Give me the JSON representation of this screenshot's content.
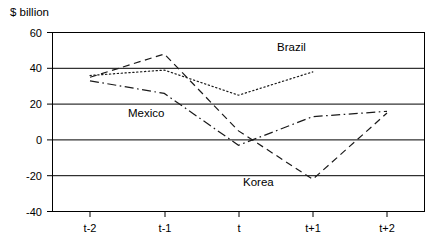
{
  "chart_data": {
    "type": "line",
    "title": "",
    "ylabel": "$ billion",
    "xlabel": "",
    "x": [
      "t-2",
      "t-1",
      "t",
      "t+1",
      "t+2"
    ],
    "categories": [
      "t-2",
      "t-1",
      "t",
      "t+1",
      "t+2"
    ],
    "ylim": [
      -40,
      60
    ],
    "yticks": [
      60,
      40,
      20,
      0,
      -20,
      -40
    ],
    "grid": "horizontal",
    "legend": "inline-annotations",
    "series": [
      {
        "name": "Brazil",
        "style": "dotted",
        "values": [
          36,
          39,
          25,
          38,
          null
        ],
        "points": [
          {
            "x": "t-2",
            "y": 36
          },
          {
            "x": "t-1",
            "y": 39
          },
          {
            "x": "t",
            "y": 25
          },
          {
            "x": "t+1",
            "y": 38
          }
        ]
      },
      {
        "name": "Korea",
        "style": "dashed",
        "values": [
          35,
          48,
          5,
          -22,
          15
        ],
        "points": [
          {
            "x": "t-2",
            "y": 35
          },
          {
            "x": "t-1",
            "y": 48
          },
          {
            "x": "t",
            "y": 5
          },
          {
            "x": "t+1",
            "y": -22
          },
          {
            "x": "t+2",
            "y": 15
          }
        ]
      },
      {
        "name": "Mexico",
        "style": "dash-dot",
        "values": [
          33,
          26,
          -3,
          13,
          16
        ],
        "points": [
          {
            "x": "t-2",
            "y": 33
          },
          {
            "x": "t-1",
            "y": 26
          },
          {
            "x": "t",
            "y": -3
          },
          {
            "x": "t+1",
            "y": 13
          },
          {
            "x": "t+2",
            "y": 16
          }
        ]
      }
    ],
    "annotations": [
      {
        "name": "Brazil",
        "label": "Brazil"
      },
      {
        "name": "Mexico",
        "label": "Mexico"
      },
      {
        "name": "Korea",
        "label": "Korea"
      }
    ]
  },
  "axis": {
    "ylabel": "$ billion",
    "yticks": [
      "60",
      "40",
      "20",
      "0",
      "-20",
      "-40"
    ],
    "xticks": [
      "t-2",
      "t-1",
      "t",
      "t+1",
      "t+2"
    ]
  },
  "labels": {
    "brazil": "Brazil",
    "mexico": "Mexico",
    "korea": "Korea"
  },
  "colors": {
    "line": "#1a1a1a",
    "frame": "#000000",
    "background": "#ffffff"
  }
}
